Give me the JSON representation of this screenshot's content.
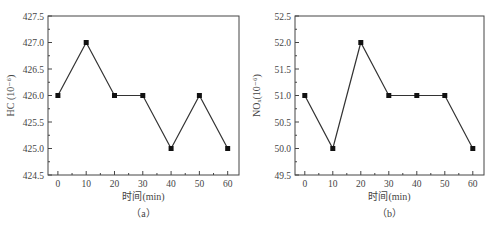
{
  "chart_data": [
    {
      "type": "line",
      "panel": "a",
      "caption": "（a）",
      "x": [
        0,
        10,
        20,
        30,
        40,
        50,
        60
      ],
      "values": [
        426.0,
        427.0,
        426.0,
        426.0,
        425.0,
        426.0,
        425.0
      ],
      "xlabel": "时间(min)",
      "ylabel": "HC (10⁻⁶)",
      "xticks": [
        "0",
        "10",
        "20",
        "30",
        "40",
        "50",
        "60"
      ],
      "yticks": [
        "424.5",
        "425.0",
        "425.5",
        "426.0",
        "426.5",
        "427.0",
        "427.5"
      ],
      "xlim": [
        -3.5,
        64
      ],
      "ylim": [
        424.5,
        427.5
      ],
      "grid": false,
      "marker": "square",
      "line_color": "#333333"
    },
    {
      "type": "line",
      "panel": "b",
      "caption": "（b）",
      "x": [
        0,
        10,
        20,
        30,
        40,
        50,
        60
      ],
      "values": [
        51.0,
        50.0,
        52.0,
        51.0,
        51.0,
        51.0,
        50.0
      ],
      "xlabel": "时间(min)",
      "ylabel": "NOₓ(10⁻⁶)",
      "xticks": [
        "0",
        "10",
        "20",
        "30",
        "40",
        "50",
        "60"
      ],
      "yticks": [
        "49.5",
        "50.0",
        "50.5",
        "51.0",
        "51.5",
        "52.0",
        "52.5"
      ],
      "xlim": [
        -3.5,
        64
      ],
      "ylim": [
        49.5,
        52.5
      ],
      "grid": false,
      "marker": "square",
      "line_color": "#333333"
    }
  ]
}
